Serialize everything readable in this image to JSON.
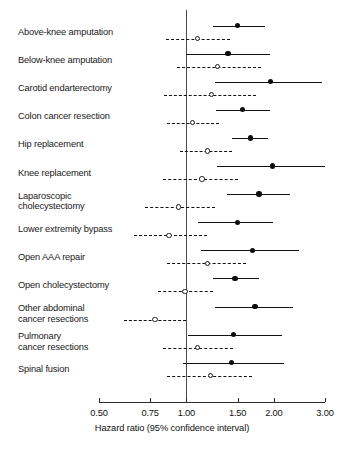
{
  "chart_data": {
    "type": "scatter",
    "title": "",
    "xlabel": "Hazard ratio (95% confidence interval)",
    "ylabel": "",
    "xscale": "log",
    "xlim": [
      0.5,
      3.0
    ],
    "xticks": [
      0.5,
      0.75,
      1.0,
      1.5,
      2.0,
      3.0
    ],
    "xticklabels": [
      "0.50",
      "0.75",
      "1.00",
      "1.50",
      "2.00",
      "3.00"
    ],
    "reference_line": 1.0,
    "grid": false,
    "legend": "none",
    "series": [
      {
        "name": "filled-marker-series",
        "marker": "filled-circle",
        "line": "solid"
      },
      {
        "name": "open-marker-series",
        "marker": "open-circle",
        "line": "dashed"
      }
    ],
    "categories": [
      "Above-knee amputation",
      "Below-knee amputation",
      "Carotid endarterectomy",
      "Colon cancer resection",
      "Hip replacement",
      "Knee replacement",
      "Laparoscopic\ncholecystectomy",
      "Lower extremity bypass",
      "Open AAA repair",
      "Open cholecystectomy",
      "Other abdominal\ncancer resections",
      "Pulmonary\ncancer resections",
      "Spinal fusion"
    ],
    "points": [
      {
        "category": "Above-knee amputation",
        "filled": {
          "estimate": 1.5,
          "low": 1.23,
          "high": 1.86
        },
        "open": {
          "estimate": 1.09,
          "low": 0.85,
          "high": 1.41
        }
      },
      {
        "category": "Below-knee amputation",
        "filled": {
          "estimate": 1.39,
          "low": 1.0,
          "high": 1.94
        },
        "open": {
          "estimate": 1.28,
          "low": 0.93,
          "high": 1.8
        }
      },
      {
        "category": "Carotid endarterectomy",
        "filled": {
          "estimate": 1.95,
          "low": 1.25,
          "high": 2.94
        },
        "open": {
          "estimate": 1.22,
          "low": 0.84,
          "high": 1.74
        }
      },
      {
        "category": "Colon cancer resection",
        "filled": {
          "estimate": 1.56,
          "low": 1.26,
          "high": 1.94
        },
        "open": {
          "estimate": 1.05,
          "low": 0.86,
          "high": 1.29
        }
      },
      {
        "category": "Hip replacement",
        "filled": {
          "estimate": 1.66,
          "low": 1.43,
          "high": 1.91
        },
        "open": {
          "estimate": 1.18,
          "low": 0.95,
          "high": 1.44
        }
      },
      {
        "category": "Knee replacement",
        "filled": {
          "estimate": 1.98,
          "low": 1.27,
          "high": 3.0
        },
        "open": {
          "estimate": 1.13,
          "low": 0.83,
          "high": 1.51
        }
      },
      {
        "category": "Laparoscopic\ncholecystectomy",
        "filled": {
          "estimate": 1.78,
          "low": 1.38,
          "high": 2.27
        },
        "open": {
          "estimate": 0.94,
          "low": 0.72,
          "high": 1.25
        }
      },
      {
        "category": "Lower extremity bypass",
        "filled": {
          "estimate": 1.5,
          "low": 1.1,
          "high": 1.98
        },
        "open": {
          "estimate": 0.87,
          "low": 0.66,
          "high": 1.18
        }
      },
      {
        "category": "Open AAA repair",
        "filled": {
          "estimate": 1.69,
          "low": 1.12,
          "high": 2.44
        },
        "open": {
          "estimate": 1.18,
          "low": 0.86,
          "high": 1.6
        }
      },
      {
        "category": "Open cholecystectomy",
        "filled": {
          "estimate": 1.47,
          "low": 1.23,
          "high": 1.78
        },
        "open": {
          "estimate": 0.99,
          "low": 0.8,
          "high": 1.23
        }
      },
      {
        "category": "Other abdominal\ncancer resections",
        "filled": {
          "estimate": 1.72,
          "low": 1.25,
          "high": 2.33
        },
        "open": {
          "estimate": 0.78,
          "low": 0.61,
          "high": 1.0
        }
      },
      {
        "category": "Pulmonary\ncancer resections",
        "filled": {
          "estimate": 1.45,
          "low": 1.01,
          "high": 2.14
        },
        "open": {
          "estimate": 1.09,
          "low": 0.83,
          "high": 1.45
        }
      },
      {
        "category": "Spinal fusion",
        "filled": {
          "estimate": 1.43,
          "low": 0.97,
          "high": 2.17
        },
        "open": {
          "estimate": 1.21,
          "low": 0.86,
          "high": 1.68
        }
      }
    ]
  },
  "layout": {
    "label_x": 18,
    "plot_left": 99,
    "plot_right": 325,
    "first_row_y": 32,
    "row_step": 28.1,
    "axis_y": 402,
    "pair_offset": 6.5
  }
}
